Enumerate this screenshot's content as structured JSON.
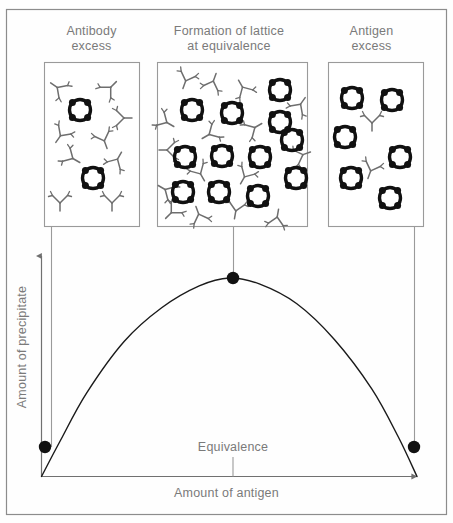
{
  "figure": {
    "title_panels": [
      {
        "id": "antibody-excess",
        "label": "Antibody\nexcess"
      },
      {
        "id": "lattice",
        "label": "Formation of lattice\nat equivalence"
      },
      {
        "id": "antigen-excess",
        "label": "Antigen\nexcess"
      }
    ],
    "axes": {
      "x_label": "Amount of antigen",
      "y_label": "Amount of precipitate",
      "equivalence_label": "Equivalence"
    },
    "colors": {
      "outer_border": "#8c8c8c",
      "panel_border": "#9a9a9a",
      "text": "#7a7a7a",
      "axis": "#707070",
      "curve": "#1a1a1a",
      "marker": "#111111",
      "antigen_ring": "#111111",
      "antibody": "#5a5a5a",
      "background": "#ffffff"
    }
  },
  "chart_data": {
    "type": "line",
    "xlabel": "Amount of antigen",
    "ylabel": "Amount of precipitate",
    "xlim": [
      0,
      1
    ],
    "ylim": [
      0,
      1
    ],
    "grid": false,
    "legend": "none",
    "series": [
      {
        "name": "Precipitate",
        "x": [
          0.0,
          0.05,
          0.12,
          0.22,
          0.32,
          0.42,
          0.5,
          0.58,
          0.68,
          0.78,
          0.88,
          0.95,
          1.0
        ],
        "y": [
          0.0,
          0.18,
          0.42,
          0.68,
          0.85,
          0.96,
          1.0,
          0.97,
          0.87,
          0.69,
          0.44,
          0.2,
          0.0
        ]
      }
    ],
    "markers": [
      {
        "name": "antibody-excess-point",
        "x": 0.03,
        "y": 0.1,
        "px": 45,
        "py": 447
      },
      {
        "name": "equivalence-point",
        "x": 0.5,
        "y": 1.0,
        "px": 233,
        "py": 278
      },
      {
        "name": "antigen-excess-point",
        "x": 0.97,
        "y": 0.1,
        "px": 414,
        "py": 447
      }
    ],
    "annotations": [
      {
        "name": "equivalence-tick",
        "text": "Equivalence",
        "x": 0.5
      }
    ]
  },
  "panels": [
    {
      "id": "antibody-excess",
      "rect": {
        "x": 44,
        "y": 62,
        "w": 95,
        "h": 164
      },
      "antigen_count": 2,
      "antibody_count": 9,
      "antigens": [
        {
          "cx": 80,
          "cy": 110,
          "r": 13
        },
        {
          "cx": 93,
          "cy": 178,
          "r": 13
        }
      ],
      "antibodies": [
        {
          "x": 58,
          "y": 88,
          "rot": 125
        },
        {
          "x": 110,
          "y": 88,
          "rot": 225
        },
        {
          "x": 123,
          "y": 118,
          "rot": 270
        },
        {
          "x": 61,
          "y": 135,
          "rot": 35
        },
        {
          "x": 104,
          "y": 140,
          "rot": 340
        },
        {
          "x": 72,
          "y": 158,
          "rot": 300
        },
        {
          "x": 117,
          "y": 160,
          "rot": 210
        },
        {
          "x": 60,
          "y": 202,
          "rot": 0
        },
        {
          "x": 112,
          "y": 202,
          "rot": 0
        }
      ]
    },
    {
      "id": "lattice",
      "rect": {
        "x": 157,
        "y": 62,
        "w": 150,
        "h": 164
      },
      "antigen_count": 12,
      "antibody_count": 16,
      "antigens": [
        {
          "cx": 192,
          "cy": 110,
          "r": 13
        },
        {
          "cx": 232,
          "cy": 113,
          "r": 13
        },
        {
          "cx": 280,
          "cy": 90,
          "r": 13
        },
        {
          "cx": 280,
          "cy": 122,
          "r": 13
        },
        {
          "cx": 185,
          "cy": 157,
          "r": 13
        },
        {
          "cx": 222,
          "cy": 156,
          "r": 13
        },
        {
          "cx": 260,
          "cy": 157,
          "r": 13
        },
        {
          "cx": 296,
          "cy": 178,
          "r": 13
        },
        {
          "cx": 183,
          "cy": 192,
          "r": 13
        },
        {
          "cx": 219,
          "cy": 192,
          "r": 13
        },
        {
          "cx": 258,
          "cy": 196,
          "r": 13
        },
        {
          "cx": 292,
          "cy": 140,
          "r": 13
        }
      ],
      "antibodies": [
        {
          "x": 186,
          "y": 80,
          "rot": 20
        },
        {
          "x": 213,
          "y": 82,
          "rot": 200
        },
        {
          "x": 243,
          "y": 88,
          "rot": 150
        },
        {
          "x": 166,
          "y": 122,
          "rot": 300
        },
        {
          "x": 210,
          "y": 134,
          "rot": 60
        },
        {
          "x": 254,
          "y": 128,
          "rot": 240
        },
        {
          "x": 168,
          "y": 150,
          "rot": 90
        },
        {
          "x": 245,
          "y": 176,
          "rot": 30
        },
        {
          "x": 302,
          "y": 155,
          "rot": 250
        },
        {
          "x": 166,
          "y": 190,
          "rot": 120
        },
        {
          "x": 200,
          "y": 173,
          "rot": 330
        },
        {
          "x": 236,
          "y": 210,
          "rot": 10
        },
        {
          "x": 277,
          "y": 218,
          "rot": 190
        },
        {
          "x": 199,
          "y": 215,
          "rot": 160
        },
        {
          "x": 300,
          "y": 105,
          "rot": 215
        },
        {
          "x": 172,
          "y": 212,
          "rot": 45
        }
      ]
    },
    {
      "id": "antigen-excess",
      "rect": {
        "x": 328,
        "y": 62,
        "w": 95,
        "h": 164
      },
      "antigen_count": 7,
      "antibody_count": 2,
      "antigens": [
        {
          "cx": 352,
          "cy": 98,
          "r": 13
        },
        {
          "cx": 392,
          "cy": 100,
          "r": 13
        },
        {
          "cx": 345,
          "cy": 137,
          "r": 13
        },
        {
          "cx": 400,
          "cy": 157,
          "r": 13
        },
        {
          "cx": 351,
          "cy": 178,
          "r": 13
        },
        {
          "cx": 390,
          "cy": 198,
          "r": 13
        },
        {
          "cx": 371,
          "cy": 124,
          "r": 0
        }
      ],
      "antibodies": [
        {
          "x": 372,
          "y": 122,
          "rot": 0
        },
        {
          "x": 371,
          "y": 170,
          "rot": 20
        }
      ]
    }
  ],
  "connectors": [
    {
      "name": "connector-antibody-excess",
      "x": 51,
      "y1": 226,
      "y2": 447
    },
    {
      "name": "connector-equivalence",
      "x": 233,
      "y1": 226,
      "y2": 278
    },
    {
      "name": "connector-antigen-excess",
      "x": 414,
      "y1": 226,
      "y2": 447
    }
  ]
}
